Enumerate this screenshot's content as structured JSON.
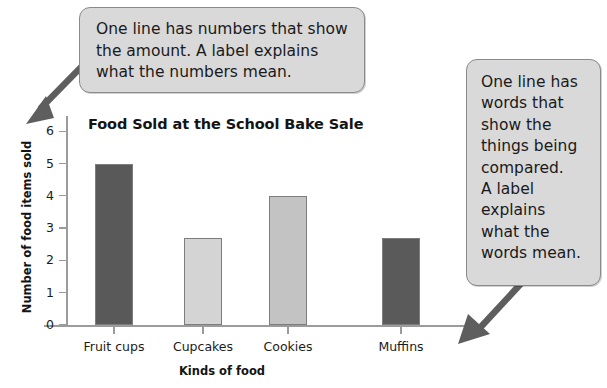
{
  "chart_data": {
    "type": "bar",
    "title": "Food Sold at the School Bake Sale",
    "xlabel": "Kinds of food",
    "ylabel": "Number of food items sold",
    "categories": [
      "Fruit cups",
      "Cupcakes",
      "Cookies",
      "Muffins"
    ],
    "values": [
      5,
      2.7,
      4,
      2.7
    ],
    "ylim": [
      0,
      6.4
    ],
    "yticks": [
      0,
      1,
      2,
      3,
      4,
      5,
      6
    ],
    "ytick_labels": [
      "0",
      "1",
      "2",
      "3",
      "4",
      "5",
      "6"
    ],
    "grid": false,
    "legend": "none",
    "bar_colors": [
      "#595959",
      "#d4d4d4",
      "#c3c3c3",
      "#5a5a5a"
    ]
  },
  "annotations": {
    "top_callout": {
      "text": "One line has numbers that show\nthe amount. A label explains\nwhat the numbers mean.",
      "arrow_name": "arrow-to-y-axis"
    },
    "right_callout": {
      "text": "One line has\nwords that\nshow the\nthings being\ncompared.\nA label\nexplains\nwhat the\nwords mean.",
      "arrow_name": "arrow-to-x-axis"
    }
  },
  "colors": {
    "callout_fill": "#d9d9d9",
    "callout_border": "#8a8a8a",
    "arrow": "#5e5e5e",
    "axis": "#9b9b9b",
    "text": "#141414"
  }
}
